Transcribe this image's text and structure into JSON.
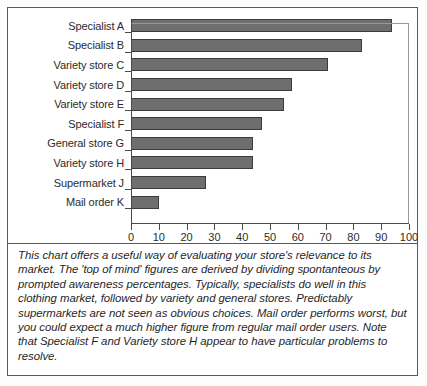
{
  "chart_data": {
    "type": "bar",
    "orientation": "horizontal",
    "title": "",
    "xlabel": "",
    "ylabel": "",
    "categories": [
      "Specialist A",
      "Specialist B",
      "Variety store C",
      "Variety store D",
      "Variety store E",
      "Specialist F",
      "General store G",
      "Variety store H",
      "Supermarket J",
      "Mail order K"
    ],
    "values": [
      94,
      83,
      71,
      58,
      55,
      47,
      44,
      44,
      27,
      10
    ],
    "xlim": [
      0,
      100
    ],
    "xticks": [
      0,
      10,
      20,
      30,
      40,
      50,
      60,
      70,
      80,
      90,
      100
    ],
    "xtick_labels": [
      "0",
      "10",
      "20",
      "30",
      "40",
      "50",
      "60",
      "70",
      "80",
      "90",
      "100"
    ],
    "grid": false,
    "legend": false,
    "bar_fill_color": "#6e6e6e",
    "bar_edge_color": "#3b3b3b",
    "axis_color": "#4a4a4a"
  },
  "note": {
    "text": "This chart offers a useful way of evaluating your store's relevance to its market. The 'top of mind' figures are derived by dividing spontanteous by prompted awareness percentages. Typically, specialists do well in this clothing market, followed by variety and general stores. Predictably supermarkets are not seen as obvious choices. Mail order performs worst, but you could expect a much higher figure from regular mail order users. Note that Specialist F and Variety store H appear to have particular problems to resolve."
  }
}
